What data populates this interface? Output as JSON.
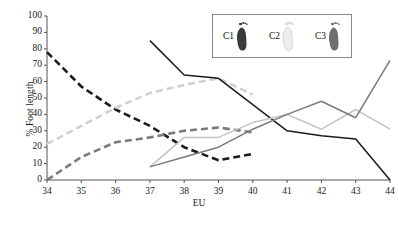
{
  "chart_data": {
    "type": "line",
    "title": "",
    "xlabel": "EU",
    "ylabel": "% Foot length",
    "xlim": [
      34,
      44
    ],
    "ylim": [
      0,
      100
    ],
    "grid": false,
    "x_ticks": [
      34,
      35,
      36,
      37,
      38,
      39,
      40,
      41,
      42,
      43,
      44
    ],
    "y_ticks": [
      0,
      10,
      20,
      30,
      40,
      50,
      60,
      70,
      80,
      90,
      100
    ],
    "legend": {
      "position": "top-right-inset",
      "entries": [
        {
          "label": "C1",
          "icon": "footprint-icon",
          "color": "#3a3a3a"
        },
        {
          "label": "C2",
          "icon": "footprint-icon",
          "color": "#d8d8d8"
        },
        {
          "label": "C3",
          "icon": "footprint-icon",
          "color": "#8a8a8a"
        }
      ]
    },
    "series": [
      {
        "name": "C1 dashed",
        "style": "dashed",
        "color": "#1a1a1a",
        "x": [
          34,
          35,
          36,
          37,
          38,
          39,
          40
        ],
        "values": [
          78,
          57,
          43,
          33,
          20,
          12,
          16
        ]
      },
      {
        "name": "C2 dashed",
        "style": "dashed",
        "color": "#d0d0d0",
        "x": [
          34,
          35,
          36,
          37,
          38,
          39,
          40
        ],
        "values": [
          22,
          33,
          44,
          53,
          58,
          62,
          52
        ]
      },
      {
        "name": "C3 dashed",
        "style": "dashed",
        "color": "#7a7a7a",
        "x": [
          34,
          35,
          36,
          37,
          38,
          39,
          40
        ],
        "values": [
          0,
          14,
          23,
          26,
          30,
          32,
          29
        ]
      },
      {
        "name": "C1 solid",
        "style": "solid",
        "color": "#1a1a1a",
        "x": [
          37,
          38,
          39,
          40,
          41,
          42,
          43,
          44
        ],
        "values": [
          85,
          64,
          62,
          46,
          30,
          27,
          25,
          0
        ]
      },
      {
        "name": "C2 solid",
        "style": "solid",
        "color": "#c4c4c4",
        "x": [
          37,
          38,
          39,
          40,
          41,
          42,
          43,
          44
        ],
        "values": [
          8,
          26,
          26,
          35,
          40,
          31,
          43,
          31
        ]
      },
      {
        "name": "C3 solid",
        "style": "solid",
        "color": "#7a7a7a",
        "x": [
          37,
          38,
          39,
          40,
          41,
          42,
          43,
          44
        ],
        "values": [
          8,
          14,
          20,
          31,
          40,
          48,
          38,
          73
        ]
      }
    ]
  }
}
